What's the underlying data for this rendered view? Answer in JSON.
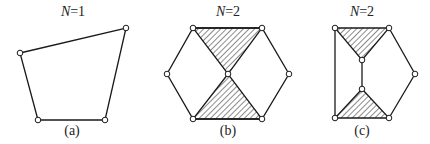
{
  "figures": [
    {
      "id": "a",
      "title_var": "N",
      "title_eq": "=1",
      "caption": "(a)",
      "title_pos": [
        73,
        4
      ],
      "caption_pos": [
        72,
        123
      ]
    },
    {
      "id": "b",
      "title_var": "N",
      "title_eq": "=2",
      "caption": "(b)",
      "title_pos": [
        228,
        4
      ],
      "caption_pos": [
        228,
        123
      ]
    },
    {
      "id": "c",
      "title_var": "N",
      "title_eq": "=2",
      "caption": "(c)",
      "title_pos": [
        362,
        4
      ],
      "caption_pos": [
        362,
        123
      ]
    }
  ],
  "colors": {
    "line": "#1a1a1a",
    "hatch": "#1a1a1a",
    "node_fill": "#ffffff"
  }
}
